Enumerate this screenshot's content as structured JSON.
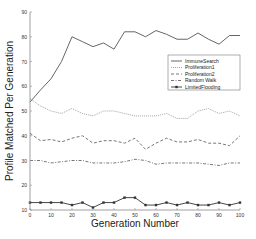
{
  "chart_data": {
    "type": "line",
    "title": "",
    "xlabel": "Generation Number",
    "ylabel": "Profile Matched Per Generation",
    "xlim": [
      0,
      100
    ],
    "ylim": [
      10,
      90
    ],
    "xticks": [
      0,
      10,
      20,
      30,
      40,
      50,
      60,
      70,
      80,
      90,
      100
    ],
    "yticks": [
      10,
      20,
      30,
      40,
      50,
      60,
      70,
      80,
      90
    ],
    "grid": false,
    "legend_position": "right-middle, inside plot",
    "x": [
      0,
      5,
      10,
      15,
      20,
      25,
      30,
      35,
      40,
      45,
      50,
      55,
      60,
      65,
      70,
      75,
      80,
      85,
      90,
      95,
      100
    ],
    "series": [
      {
        "name": "ImmuneSearch",
        "style": "solid",
        "color": "#555555",
        "values": [
          53.6,
          58.5,
          63,
          70,
          80,
          78,
          76,
          77.5,
          75,
          82,
          82,
          80,
          82.5,
          81,
          79,
          79,
          81.5,
          79,
          77,
          80.5,
          80.5
        ]
      },
      {
        "name": "Proliferation1",
        "style": "dotted",
        "color": "#999999",
        "values": [
          55,
          52,
          50,
          49,
          51,
          49,
          48,
          50,
          50,
          49,
          48,
          48,
          48,
          49,
          47,
          47,
          50,
          51,
          49,
          50,
          48
        ]
      },
      {
        "name": "Proliferation2",
        "style": "dashed",
        "color": "#666666",
        "values": [
          41,
          38,
          38.5,
          37.5,
          39,
          40,
          37,
          38,
          38,
          37,
          39,
          34.5,
          37,
          39,
          37.5,
          37.5,
          38.5,
          37,
          37,
          36,
          40
        ]
      },
      {
        "name": "Random Walk",
        "style": "dash-dot",
        "color": "#666666",
        "values": [
          30,
          30,
          29,
          29.5,
          30,
          30,
          29,
          29,
          29,
          29.5,
          30.5,
          30,
          28.5,
          29,
          29,
          29,
          29,
          28.5,
          28,
          29,
          29
        ]
      },
      {
        "name": "LimitedFlooding",
        "style": "solid-with-markers",
        "color": "#333333",
        "values": [
          13,
          13,
          13,
          13,
          12,
          13,
          11,
          13,
          13,
          15,
          15,
          12,
          12,
          13,
          12,
          13,
          12,
          12,
          13,
          12,
          13
        ]
      }
    ]
  }
}
